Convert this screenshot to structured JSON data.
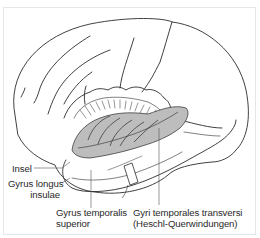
{
  "figure": {
    "colors": {
      "outline": "#2b2b2b",
      "insula_fill": "#bdbdbd",
      "frame": "#e6e6e6",
      "label_text": "#2a2a2a"
    },
    "labels": {
      "insel": "Insel",
      "gyrus_longus_1": "Gyrus longus",
      "gyrus_longus_2": "insulae",
      "gyrus_temporalis_1": "Gyrus temporalis",
      "gyrus_temporalis_2": "superior",
      "gyri_transversi_1": "Gyri temporales transversi",
      "gyri_transversi_2": "(Heschl-Querwindungen)"
    }
  }
}
